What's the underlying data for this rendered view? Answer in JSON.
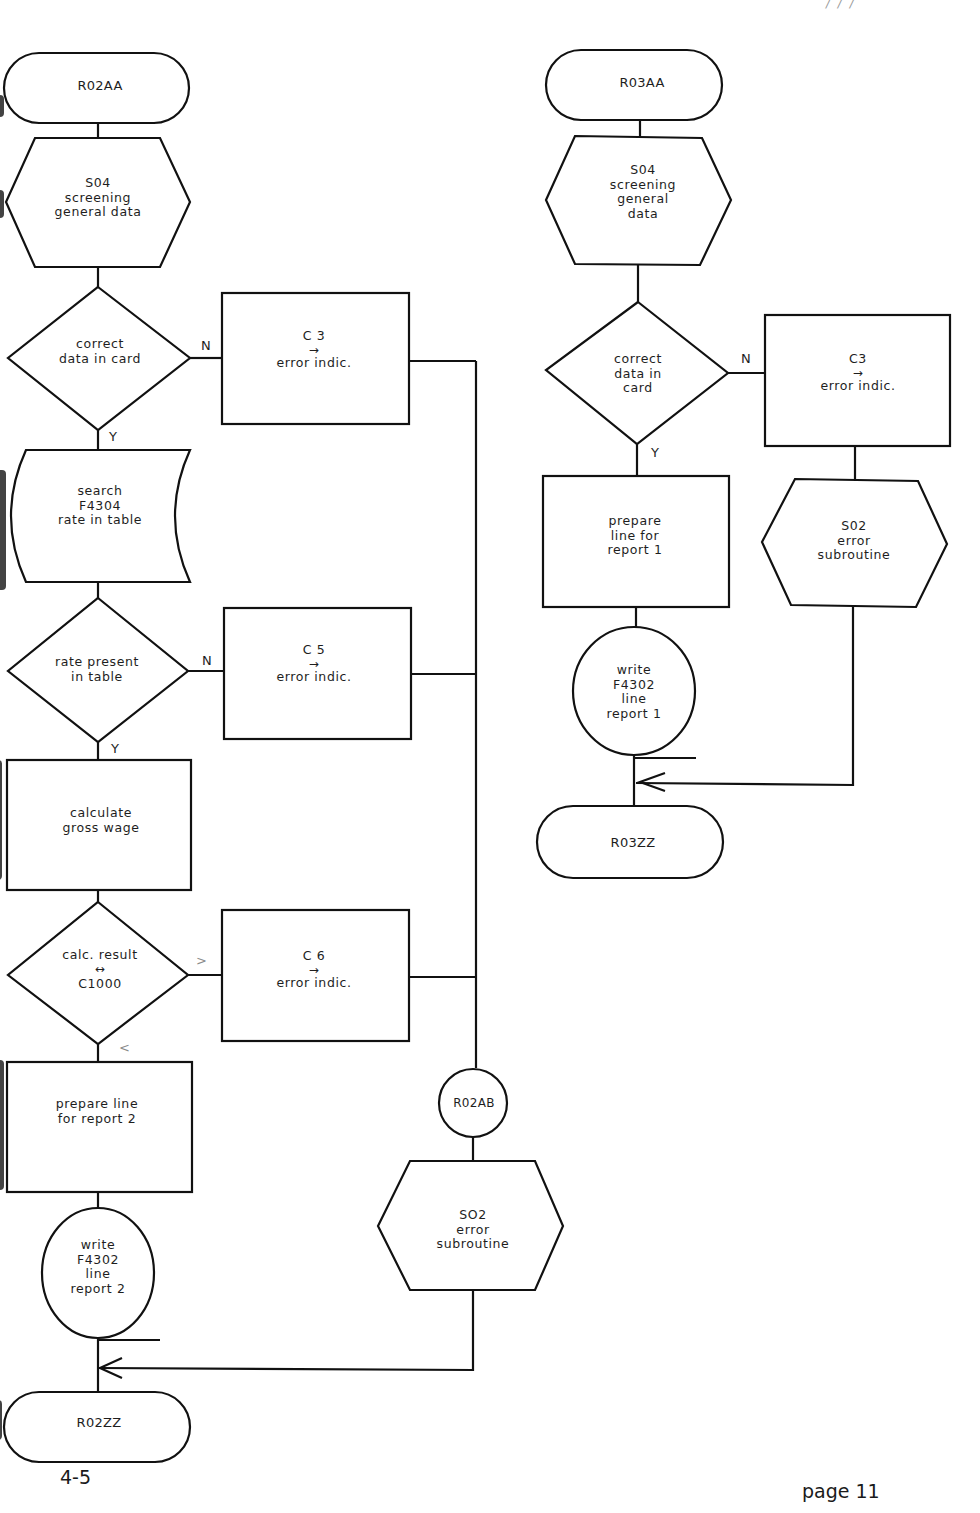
{
  "page": {
    "corner_mark": "/ / /",
    "figure_number": "4-5",
    "page_label": "page 11"
  },
  "flow_r02": {
    "start": "R02AA",
    "screening": {
      "line1": "S04",
      "line2": "screening",
      "line3": "general data"
    },
    "decision_card": {
      "line1": "correct",
      "line2": "data in card",
      "no": "N",
      "yes": "Y"
    },
    "error_c3": {
      "code": "C 3",
      "arrow": "→",
      "text": "error indic."
    },
    "search": {
      "line1": "search",
      "line2": "F4304",
      "line3": "rate in table"
    },
    "decision_rate": {
      "line1": "rate present",
      "line2": "in table",
      "no": "N",
      "yes": "Y"
    },
    "error_c5": {
      "code": "C 5",
      "arrow": "→",
      "text": "error indic."
    },
    "calculate": {
      "line1": "calculate",
      "line2": "gross wage"
    },
    "decision_calc": {
      "line1": "calc. result",
      "compare": "↔",
      "line2": "C1000",
      "greater": ">",
      "less": "<"
    },
    "error_c6": {
      "code": "C 6",
      "arrow": "→",
      "text": "error indic."
    },
    "prepare": {
      "line1": "prepare line",
      "line2": "for report 2"
    },
    "write": {
      "line1": "write",
      "line2": "F4302",
      "line3": "line",
      "line4": "report 2"
    },
    "connector": "R02AB",
    "error_sub": {
      "line1": "SO2",
      "line2": "error",
      "line3": "subroutine"
    },
    "end": "R02ZZ"
  },
  "flow_r03": {
    "start": "R03AA",
    "screening": {
      "line1": "S04",
      "line2": "screening",
      "line3": "general",
      "line4": "data"
    },
    "decision_card": {
      "line1": "correct",
      "line2": "data in",
      "line3": "card",
      "no": "N",
      "yes": "Y"
    },
    "error_c3": {
      "code": "C3",
      "arrow": "→",
      "text": "error indic."
    },
    "error_sub": {
      "line1": "S02",
      "line2": "error",
      "line3": "subroutine"
    },
    "prepare": {
      "line1": "prepare",
      "line2": "line for",
      "line3": "report 1"
    },
    "write": {
      "line1": "write",
      "line2": "F4302",
      "line3": "line",
      "line4": "report 1"
    },
    "end": "R03ZZ"
  }
}
